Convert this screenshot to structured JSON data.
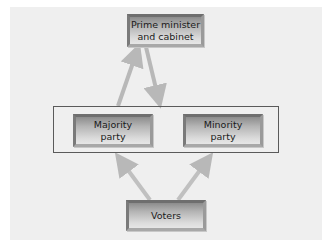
{
  "diagram": {
    "type": "flow",
    "nodes": {
      "prime_minister": {
        "label": "Prime minister\nand cabinet"
      },
      "majority_party": {
        "label": "Majority\nparty"
      },
      "minority_party": {
        "label": "Minority\nparty"
      },
      "voters": {
        "label": "Voters"
      }
    },
    "groups": [
      {
        "name": "parliament-parties",
        "members": [
          "majority_party",
          "minority_party"
        ]
      }
    ],
    "edges": [
      {
        "from": "majority_party",
        "to": "prime_minister"
      },
      {
        "from": "prime_minister",
        "to": "parliament-parties"
      },
      {
        "from": "voters",
        "to": "majority_party"
      },
      {
        "from": "voters",
        "to": "minority_party"
      }
    ],
    "colors": {
      "panel_background": "#efefef",
      "arrow": "#b8b8b8",
      "frame_border": "#5a5a5a"
    }
  }
}
